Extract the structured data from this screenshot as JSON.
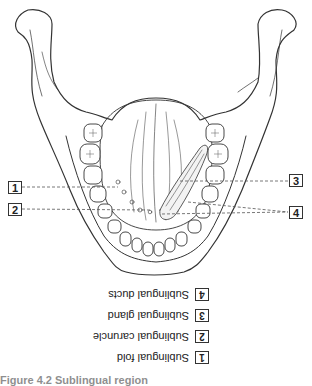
{
  "figure": {
    "callouts": [
      {
        "number": "1",
        "side": "left",
        "y": 187
      },
      {
        "number": "2",
        "side": "left",
        "y": 209
      },
      {
        "number": "3",
        "side": "right",
        "y": 181
      },
      {
        "number": "4",
        "side": "right",
        "y": 212
      }
    ],
    "legend_orientation": "rotated 180 degrees",
    "legend": [
      {
        "number": "4",
        "label": "Sublingual ducts"
      },
      {
        "number": "3",
        "label": "Sublingual gland"
      },
      {
        "number": "2",
        "label": "Sublingual caruncle"
      },
      {
        "number": "1",
        "label": "Sublingual fold"
      }
    ],
    "caption": "Figure 4.2  Sublingual region"
  },
  "colors": {
    "line": "#333333",
    "leader": "#555555",
    "background": "#ffffff"
  }
}
